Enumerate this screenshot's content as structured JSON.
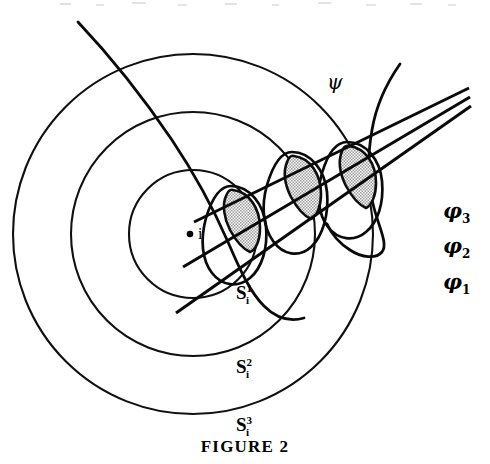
{
  "figure": {
    "caption": "FIGURE 2",
    "center_point_label": "i",
    "psi_label": "ψ",
    "background_color": "#ffffff",
    "ink_color": "#0a0a0a",
    "shade_color": "#c9c9c9"
  },
  "spheres": [
    {
      "name": "sphere-1",
      "base": "S",
      "superscript": "1",
      "subscript": "i",
      "cx": 193,
      "cy": 234,
      "r": 64,
      "label_x": 236,
      "label_y": 283
    },
    {
      "name": "sphere-2",
      "base": "S",
      "superscript": "2",
      "subscript": "i",
      "cx": 193,
      "cy": 234,
      "r": 122,
      "label_x": 236,
      "label_y": 357
    },
    {
      "name": "sphere-3",
      "base": "S",
      "superscript": "3",
      "subscript": "i",
      "cx": 193,
      "cy": 234,
      "r": 180,
      "label_x": 236,
      "label_y": 415
    }
  ],
  "phi_lines": [
    {
      "name": "phi-3",
      "base": "φ",
      "subscript": "3",
      "label_x": 443,
      "label_y": 212
    },
    {
      "name": "phi-2",
      "base": "φ",
      "subscript": "2",
      "label_x": 443,
      "label_y": 247
    },
    {
      "name": "phi-1",
      "base": "φ",
      "subscript": "1",
      "label_x": 443,
      "label_y": 283
    }
  ],
  "shaded_regions": [
    {
      "name": "shaded-lens-1"
    },
    {
      "name": "shaded-lens-2"
    },
    {
      "name": "shaded-lens-3"
    }
  ]
}
